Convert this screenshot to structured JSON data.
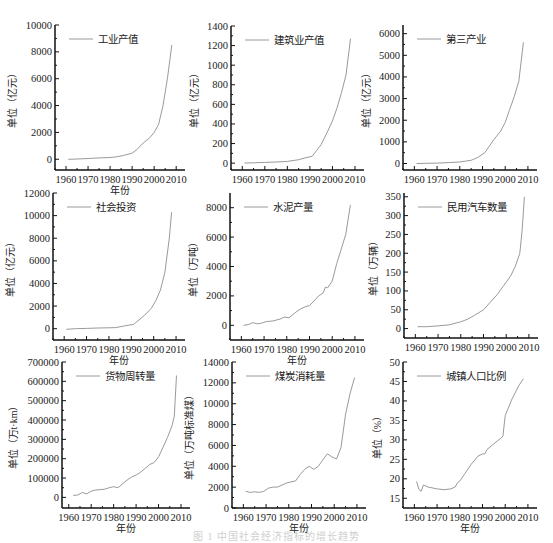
{
  "figure": {
    "width": 553,
    "height": 543,
    "line_color": "#9a9a9a",
    "axis_color": "#111111",
    "caption": "图 1 中国社会经济指标的增长趋势"
  },
  "chart_data": [
    {
      "type": "line",
      "id": "industrial-output",
      "legend": "工业产值",
      "ylabel": "单位（亿元）",
      "xlabel": "年份",
      "show_xlabel": true,
      "x_ticks": [
        1960,
        1970,
        1980,
        1990,
        2000,
        2010
      ],
      "xlim": [
        1955,
        2014
      ],
      "y_ticks": [
        0,
        2000,
        4000,
        6000,
        8000,
        10000
      ],
      "ylim": [
        -800,
        10000
      ],
      "x": [
        1961,
        1965,
        1970,
        1975,
        1980,
        1983,
        1986,
        1990,
        1992,
        1995,
        1998,
        2000,
        2002,
        2004,
        2006,
        2008
      ],
      "y": [
        0,
        20,
        60,
        100,
        130,
        180,
        280,
        450,
        700,
        1200,
        1600,
        2000,
        2600,
        4000,
        6000,
        8500
      ]
    },
    {
      "type": "line",
      "id": "construction-output",
      "legend": "建筑业产值",
      "ylabel": "单位（亿元）",
      "xlabel": "年份",
      "show_xlabel": false,
      "x_ticks": [
        1960,
        1970,
        1980,
        1990,
        2000,
        2010
      ],
      "xlim": [
        1955,
        2014
      ],
      "y_ticks": [
        0,
        200,
        400,
        600,
        800,
        1000,
        1200,
        1400
      ],
      "ylim": [
        -70,
        1400
      ],
      "x": [
        1961,
        1965,
        1970,
        1975,
        1980,
        1985,
        1988,
        1991,
        1993,
        1995,
        1998,
        2000,
        2002,
        2004,
        2006,
        2008
      ],
      "y": [
        0,
        3,
        8,
        12,
        18,
        35,
        55,
        70,
        130,
        190,
        330,
        430,
        560,
        720,
        900,
        1270
      ]
    },
    {
      "type": "line",
      "id": "tertiary-industry",
      "legend": "第三产业",
      "ylabel": "单位（亿元）",
      "xlabel": "年份",
      "show_xlabel": false,
      "x_ticks": [
        1960,
        1970,
        1980,
        1990,
        2000,
        2010
      ],
      "xlim": [
        1955,
        2014
      ],
      "y_ticks": [
        0,
        1000,
        2000,
        3000,
        4000,
        5000,
        6000
      ],
      "ylim": [
        -300,
        6400
      ],
      "x": [
        1961,
        1965,
        1970,
        1975,
        1980,
        1985,
        1988,
        1991,
        1993,
        1995,
        1998,
        2000,
        2002,
        2004,
        2006,
        2008
      ],
      "y": [
        0,
        10,
        20,
        40,
        70,
        150,
        280,
        500,
        800,
        1100,
        1500,
        1900,
        2500,
        3100,
        3800,
        5600
      ]
    },
    {
      "type": "line",
      "id": "social-investment",
      "legend": "社会投资",
      "ylabel": "单位（亿元）",
      "xlabel": "年份",
      "show_xlabel": true,
      "x_ticks": [
        1960,
        1970,
        1980,
        1990,
        2000,
        2010
      ],
      "xlim": [
        1955,
        2014
      ],
      "y_ticks": [
        0,
        2000,
        4000,
        6000,
        8000,
        10000,
        12000
      ],
      "ylim": [
        -1000,
        12000
      ],
      "x": [
        1961,
        1965,
        1970,
        1975,
        1980,
        1983,
        1987,
        1991,
        1993,
        1996,
        1999,
        2001,
        2003,
        2005,
        2007,
        2008
      ],
      "y": [
        -50,
        0,
        30,
        60,
        80,
        100,
        250,
        380,
        700,
        1200,
        1800,
        2500,
        3400,
        5000,
        8000,
        10300
      ]
    },
    {
      "type": "line",
      "id": "cement-production",
      "legend": "水泥产量",
      "ylabel": "单位（万吨）",
      "xlabel": "年份",
      "show_xlabel": true,
      "x_ticks": [
        1960,
        1970,
        1980,
        1990,
        2000,
        2010
      ],
      "xlim": [
        1955,
        2014
      ],
      "y_ticks": [
        0,
        2000,
        4000,
        6000,
        8000
      ],
      "ylim": [
        -1000,
        9000
      ],
      "x": [
        1961,
        1963,
        1965,
        1967,
        1969,
        1971,
        1974,
        1977,
        1979,
        1981,
        1984,
        1986,
        1988,
        1990,
        1992,
        1994,
        1996,
        1997,
        1998,
        2000,
        2002,
        2004,
        2006,
        2008
      ],
      "y": [
        0,
        50,
        180,
        100,
        150,
        250,
        300,
        420,
        560,
        520,
        900,
        1100,
        1250,
        1350,
        1650,
        2000,
        2200,
        2600,
        2550,
        3000,
        4200,
        5200,
        6200,
        8200
      ]
    },
    {
      "type": "line",
      "id": "civil-vehicles",
      "legend": "民用汽车数量",
      "ylabel": "单位（万辆）",
      "xlabel": "年份",
      "show_xlabel": false,
      "x_ticks": [
        1960,
        1970,
        1980,
        1990,
        2000,
        2010
      ],
      "x_tick_labels": [
        "1960",
        "1970",
        "1980",
        "1990",
        "2000",
        "2010"
      ],
      "xlim": [
        1955,
        2014
      ],
      "y_ticks": [
        0,
        50,
        100,
        150,
        200,
        250,
        300,
        350
      ],
      "ylim": [
        -25,
        360
      ],
      "x": [
        1961,
        1965,
        1970,
        1975,
        1980,
        1983,
        1986,
        1990,
        1993,
        1996,
        1999,
        2002,
        2004,
        2006,
        2007,
        2008
      ],
      "y": [
        5,
        5,
        7,
        10,
        18,
        25,
        35,
        50,
        70,
        90,
        115,
        140,
        165,
        200,
        260,
        350
      ]
    },
    {
      "type": "line",
      "id": "freight-turnover",
      "legend": "货物周转量",
      "ylabel": "单位（万t·km）",
      "xlabel": "年份",
      "show_xlabel": true,
      "x_ticks": [
        1960,
        1970,
        1980,
        1990,
        2000,
        2010
      ],
      "xlim": [
        1957,
        2014
      ],
      "y_ticks": [
        0,
        100000,
        200000,
        300000,
        400000,
        500000,
        600000,
        700000
      ],
      "ylim": [
        -55000,
        700000
      ],
      "x": [
        1962,
        1964,
        1966,
        1968,
        1970,
        1972,
        1974,
        1976,
        1978,
        1980,
        1982,
        1984,
        1986,
        1988,
        1990,
        1992,
        1994,
        1996,
        1998,
        2000,
        2002,
        2004,
        2006,
        2007,
        2008
      ],
      "y": [
        10000,
        12000,
        25000,
        18000,
        32000,
        38000,
        40000,
        42000,
        50000,
        55000,
        50000,
        70000,
        90000,
        105000,
        115000,
        130000,
        150000,
        170000,
        180000,
        210000,
        260000,
        310000,
        370000,
        420000,
        630000
      ]
    },
    {
      "type": "line",
      "id": "coal-consumption",
      "legend": "煤炭消耗量",
      "ylabel": "单位（万吨标准煤）",
      "xlabel": "年份",
      "show_xlabel": true,
      "x_ticks": [
        1960,
        1970,
        1980,
        1990,
        2000,
        2010
      ],
      "xlim": [
        1955,
        2014
      ],
      "y_ticks": [
        0,
        2000,
        4000,
        6000,
        8000,
        10000,
        12000,
        14000
      ],
      "ylim": [
        0,
        14000
      ],
      "x": [
        1961,
        1963,
        1965,
        1967,
        1969,
        1971,
        1973,
        1975,
        1977,
        1979,
        1981,
        1983,
        1985,
        1987,
        1989,
        1991,
        1993,
        1995,
        1997,
        1999,
        2001,
        2003,
        2005,
        2007,
        2009
      ],
      "y": [
        1600,
        1500,
        1550,
        1500,
        1600,
        1900,
        2000,
        2000,
        2200,
        2400,
        2500,
        2600,
        3200,
        3700,
        4000,
        3700,
        4000,
        4600,
        5200,
        4900,
        4700,
        5800,
        9000,
        11000,
        12500
      ]
    },
    {
      "type": "line",
      "id": "urban-population-ratio",
      "legend": "城镇人口比例",
      "ylabel": "单位（%）",
      "xlabel": "年份",
      "show_xlabel": true,
      "x_ticks": [
        1960,
        1970,
        1980,
        1990,
        2000,
        2010
      ],
      "xlim": [
        1955,
        2014
      ],
      "y_ticks": [
        15,
        20,
        25,
        30,
        35,
        40,
        45,
        50
      ],
      "ylim": [
        12.5,
        50
      ],
      "x": [
        1961,
        1962,
        1963,
        1964,
        1966,
        1970,
        1973,
        1976,
        1978,
        1979,
        1980,
        1982,
        1985,
        1988,
        1990,
        1991,
        1992,
        1995,
        1998,
        1999,
        2000,
        2003,
        2006,
        2008
      ],
      "y": [
        19.3,
        17.3,
        16.8,
        18.4,
        17.9,
        17.4,
        17.2,
        17.4,
        17.9,
        19.0,
        19.4,
        21.1,
        23.7,
        25.8,
        26.4,
        26.4,
        27.5,
        29.0,
        30.4,
        30.9,
        36.2,
        40.5,
        43.9,
        45.7
      ]
    }
  ]
}
